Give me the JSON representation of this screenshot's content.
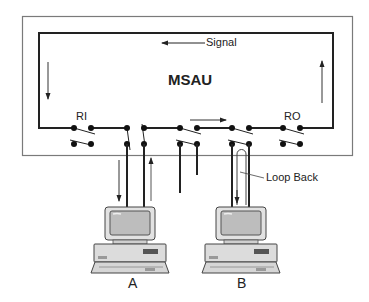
{
  "diagram": {
    "title": "MSAU",
    "signal_label": "Signal",
    "ring_in_label": "RI",
    "ring_out_label": "RO",
    "loop_back_label": "Loop Back",
    "stations": [
      {
        "id": "A",
        "label": "A"
      },
      {
        "id": "B",
        "label": "B"
      }
    ],
    "colors": {
      "outer_box": "#777777",
      "ring": "#222222",
      "dot": "#111111",
      "arrow": "#333333",
      "computer_body": "#dedede",
      "computer_screen": "#bdbdbd"
    }
  }
}
